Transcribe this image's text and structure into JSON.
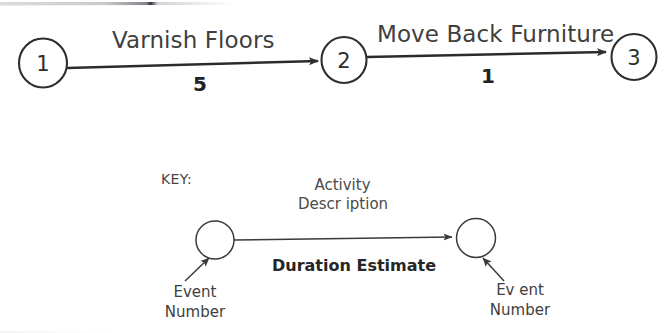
{
  "diagram": {
    "title_text": "Activity on Arrow Network Diagram",
    "nodes": [
      {
        "id": "n1",
        "label": "1"
      },
      {
        "id": "n2",
        "label": "2"
      },
      {
        "id": "n3",
        "label": "3"
      }
    ],
    "arrows": [
      {
        "id": "a1",
        "from": "1",
        "to": "2",
        "activity": "Varnish Floors",
        "duration": "5"
      },
      {
        "id": "a2",
        "from": "2",
        "to": "3",
        "activity": "Move Back Furniture",
        "duration": "1"
      }
    ]
  },
  "key": {
    "heading": "KEY:",
    "activity_line1": "Activity",
    "activity_line2": "Descr iption",
    "duration": "Duration Estimate",
    "left_event_line1": "Event",
    "left_event_line2": "Number",
    "right_event_line1": "Ev ent",
    "right_event_line2": "Number"
  },
  "colors": {
    "background": "#ffffff",
    "stroke": "#2e2e2e",
    "text": "#3b3b3b",
    "bold_text": "#222222"
  }
}
